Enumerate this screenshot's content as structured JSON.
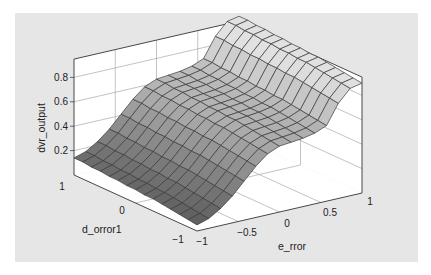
{
  "chart_data": {
    "type": "surface",
    "title": "",
    "xlabel": "e_rror",
    "ylabel": "d_orror1",
    "zlabel": "dvr_output",
    "x_ticks": [
      "-1",
      "-0.5",
      "0",
      "0.5",
      "1"
    ],
    "y_ticks": [
      "-1",
      "0",
      "1"
    ],
    "z_ticks": [
      "0.2",
      "0.4",
      "0.6",
      "0.8"
    ],
    "xlim": [
      -1,
      1
    ],
    "ylim": [
      -1,
      1
    ],
    "zlim": [
      0,
      0.95
    ],
    "grid": true,
    "colormap": "gray",
    "grid_resolution": [
      15,
      15
    ],
    "x": [
      -1,
      -0.857,
      -0.714,
      -0.571,
      -0.429,
      -0.286,
      -0.143,
      0,
      0.143,
      0.286,
      0.429,
      0.571,
      0.714,
      0.857,
      1
    ],
    "y": [
      -1,
      -0.857,
      -0.714,
      -0.571,
      -0.429,
      -0.286,
      -0.143,
      0,
      0.143,
      0.286,
      0.429,
      0.571,
      0.714,
      0.857,
      1
    ],
    "z_profile_along_x": [
      0.05,
      0.08,
      0.14,
      0.22,
      0.32,
      0.42,
      0.5,
      0.54,
      0.55,
      0.56,
      0.58,
      0.62,
      0.78,
      0.88,
      0.9
    ],
    "z_offset_along_y": [
      0,
      0.01,
      0.02,
      0.03,
      0.04,
      0.05,
      0.05,
      0.06,
      0.06,
      0.07,
      0.07,
      0.08,
      0.08,
      0.09,
      0.09
    ]
  },
  "axes": {
    "zlabel": "dvr_output",
    "xlabel": "e_rror",
    "ylabel": "d_orror1"
  }
}
